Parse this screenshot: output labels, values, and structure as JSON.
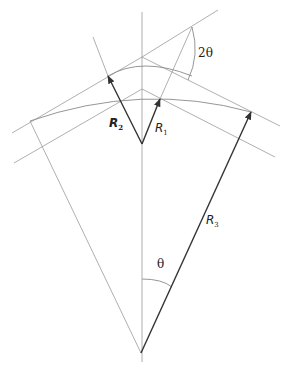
{
  "diagram": {
    "labels": {
      "two_theta": "2θ",
      "theta": "θ",
      "r1_main": "R",
      "r1_sub": "1",
      "r2_main": "R",
      "r2_sub": "2",
      "r3_main": "R",
      "r3_sub": "3"
    },
    "colors": {
      "construction_line": "#9a9a9a",
      "vector": "#333333",
      "background": "#ffffff"
    }
  }
}
